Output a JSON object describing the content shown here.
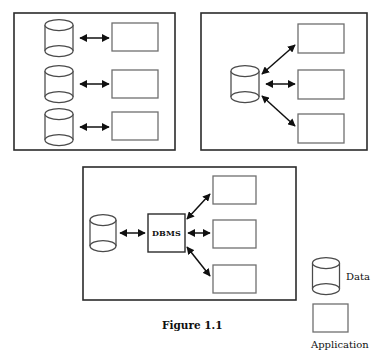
{
  "figure": {
    "caption": "Figure 1.1",
    "caption_x": 162,
    "caption_y": 329
  },
  "panels": [
    {
      "id": "panel-isolated-files",
      "frame": {
        "x": 14,
        "y": 13,
        "w": 161,
        "h": 137
      },
      "data_stores": [
        {
          "id": "data-store-1",
          "cx": 59,
          "cy": 38,
          "rx": 14,
          "ry": 5.5,
          "h": 26
        },
        {
          "id": "data-store-2",
          "cx": 59,
          "cy": 84,
          "rx": 14,
          "ry": 5.5,
          "h": 26
        },
        {
          "id": "data-store-3",
          "cx": 59,
          "cy": 127,
          "rx": 14,
          "ry": 5.5,
          "h": 26
        }
      ],
      "applications": [
        {
          "id": "application-1",
          "x": 112,
          "y": 23,
          "w": 46,
          "h": 28
        },
        {
          "id": "application-2",
          "x": 112,
          "y": 70,
          "w": 46,
          "h": 28
        },
        {
          "id": "application-3",
          "x": 112,
          "y": 112,
          "w": 46,
          "h": 28
        }
      ],
      "connections": [
        {
          "id": "link-1",
          "x1": 80,
          "y1": 38,
          "x2": 109,
          "y2": 38
        },
        {
          "id": "link-2",
          "x1": 80,
          "y1": 84,
          "x2": 109,
          "y2": 84
        },
        {
          "id": "link-3",
          "x1": 80,
          "y1": 127,
          "x2": 109,
          "y2": 127
        }
      ]
    },
    {
      "id": "panel-shared-data",
      "frame": {
        "x": 201,
        "y": 13,
        "w": 166,
        "h": 137
      },
      "data_stores": [
        {
          "id": "data-store-shared",
          "cx": 245,
          "cy": 84,
          "rx": 14,
          "ry": 5.5,
          "h": 26
        }
      ],
      "applications": [
        {
          "id": "application-4",
          "x": 298,
          "y": 24,
          "w": 46,
          "h": 29
        },
        {
          "id": "application-5",
          "x": 298,
          "y": 70,
          "w": 46,
          "h": 29
        },
        {
          "id": "application-6",
          "x": 298,
          "y": 114,
          "w": 46,
          "h": 29
        }
      ],
      "connections": [
        {
          "id": "link-4",
          "x1": 262,
          "y1": 74,
          "x2": 295,
          "y2": 45
        },
        {
          "id": "link-5",
          "x1": 266,
          "y1": 84,
          "x2": 295,
          "y2": 84
        },
        {
          "id": "link-6",
          "x1": 262,
          "y1": 96,
          "x2": 295,
          "y2": 126
        }
      ]
    },
    {
      "id": "panel-dbms",
      "frame": {
        "x": 83,
        "y": 167,
        "w": 213,
        "h": 133
      },
      "data_stores": [
        {
          "id": "data-store-dbms",
          "cx": 103,
          "cy": 233,
          "rx": 13,
          "ry": 5.5,
          "h": 26
        }
      ],
      "dbms": {
        "id": "dbms-box",
        "label": "DBMS",
        "x": 148,
        "y": 214,
        "w": 37,
        "h": 38
      },
      "applications": [
        {
          "id": "application-7",
          "x": 213,
          "y": 176,
          "w": 43,
          "h": 28
        },
        {
          "id": "application-8",
          "x": 213,
          "y": 220,
          "w": 43,
          "h": 28
        },
        {
          "id": "application-9",
          "x": 213,
          "y": 265,
          "w": 43,
          "h": 28
        }
      ],
      "connections": [
        {
          "id": "link-7",
          "x1": 120,
          "y1": 233,
          "x2": 145,
          "y2": 233
        },
        {
          "id": "link-8",
          "x1": 187,
          "y1": 219,
          "x2": 210,
          "y2": 194
        },
        {
          "id": "link-9",
          "x1": 188,
          "y1": 233,
          "x2": 210,
          "y2": 233
        },
        {
          "id": "link-10",
          "x1": 187,
          "y1": 247,
          "x2": 210,
          "y2": 276
        }
      ]
    }
  ],
  "legend": {
    "data": {
      "label": "Data",
      "label_x": 346,
      "label_y": 280,
      "cylinder": {
        "cx": 326,
        "cy": 276,
        "rx": 13.5,
        "ry": 5.5,
        "h": 26
      }
    },
    "application": {
      "label": "Application",
      "label_x": 311,
      "label_y": 348,
      "box": {
        "x": 313,
        "y": 304,
        "w": 35,
        "h": 28
      }
    }
  },
  "colors": {
    "frame_stroke": "#2b2b2b",
    "box_stroke": "#6f6f6f",
    "cylinder_stroke": "#4a4a4a",
    "arrow": "#101010",
    "background": "#ffffff"
  }
}
